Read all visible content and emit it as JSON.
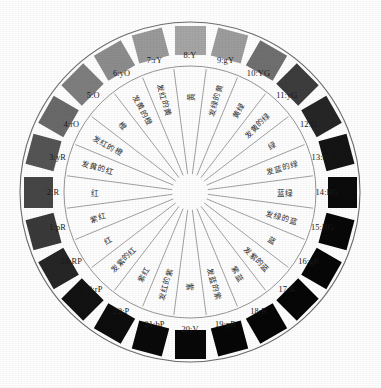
{
  "figure": {
    "type": "color-wheel",
    "hue_count": 24,
    "background_color": "#ffffff",
    "ring_outline_color": "#6e6e6e",
    "spoke_color": "#7a7a7a",
    "label_color": "#1a1a1a"
  },
  "chart_data": {
    "type": "pie",
    "xlabel": "",
    "ylabel": "",
    "legend": "none",
    "grid": false,
    "categories": [
      "1:pR",
      "2:R",
      "3:yR",
      "4:rO",
      "5:O",
      "6:yO",
      "7:rY",
      "8:Y",
      "9:gY",
      "10:YG",
      "11:yG",
      "12:G",
      "13:bG",
      "14:BG",
      "15:BG",
      "16:gB",
      "17:B",
      "18:B",
      "19:pB",
      "20:V",
      "21:bP",
      "22:P",
      "23:rP",
      "24:RP"
    ],
    "values": [
      15,
      15,
      15,
      15,
      15,
      15,
      15,
      15,
      15,
      15,
      15,
      15,
      15,
      15,
      15,
      15,
      15,
      15,
      15,
      15,
      15,
      15,
      15,
      15
    ],
    "swatch_colors": [
      "#3a3a3a",
      "#464646",
      "#555555",
      "#6a6a6a",
      "#7e7e7e",
      "#8d8d8d",
      "#9a9a9a",
      "#a6a6a6",
      "#9d9d9d",
      "#707070",
      "#3d3d3d",
      "#262626",
      "#141414",
      "#0b0b0b",
      "#080808",
      "#070707",
      "#060606",
      "#060606",
      "#070707",
      "#080808",
      "#0a0a0a",
      "#0d0d0d",
      "#121212",
      "#262626"
    ]
  },
  "outer_labels": [
    {
      "id": 1,
      "code": "1:pR"
    },
    {
      "id": 2,
      "code": "2:R"
    },
    {
      "id": 3,
      "code": "3:yR"
    },
    {
      "id": 4,
      "code": "4:rO"
    },
    {
      "id": 5,
      "code": "5:O"
    },
    {
      "id": 6,
      "code": "6:yO"
    },
    {
      "id": 7,
      "code": "7:rY"
    },
    {
      "id": 8,
      "code": "8:Y"
    },
    {
      "id": 9,
      "code": "9:gY"
    },
    {
      "id": 10,
      "code": "10:YG"
    },
    {
      "id": 11,
      "code": "11:yG"
    },
    {
      "id": 12,
      "code": "12:G"
    },
    {
      "id": 13,
      "code": "13:bG"
    },
    {
      "id": 14,
      "code": "14:BG"
    },
    {
      "id": 15,
      "code": "15:BG"
    },
    {
      "id": 16,
      "code": "16:gB"
    },
    {
      "id": 17,
      "code": "17:B"
    },
    {
      "id": 18,
      "code": "18:B"
    },
    {
      "id": 19,
      "code": "19:pB"
    },
    {
      "id": 20,
      "code": "20:V"
    },
    {
      "id": 21,
      "code": "21:bP"
    },
    {
      "id": 22,
      "code": "22:P"
    },
    {
      "id": 23,
      "code": "23:rP"
    },
    {
      "id": 24,
      "code": "24:RP"
    }
  ],
  "inner_labels": [
    {
      "id": 1,
      "name": "紫红"
    },
    {
      "id": 2,
      "name": "红"
    },
    {
      "id": 3,
      "name": "发黄的红"
    },
    {
      "id": 4,
      "name": "发红的橙"
    },
    {
      "id": 5,
      "name": "橙"
    },
    {
      "id": 6,
      "name": "发黄的橙"
    },
    {
      "id": 7,
      "name": "发红的黄"
    },
    {
      "id": 8,
      "name": "黄"
    },
    {
      "id": 9,
      "name": "发绿的黄"
    },
    {
      "id": 10,
      "name": "黄绿"
    },
    {
      "id": 11,
      "name": "发黄的绿"
    },
    {
      "id": 12,
      "name": "绿"
    },
    {
      "id": 13,
      "name": "发蓝的绿"
    },
    {
      "id": 14,
      "name": "蓝绿"
    },
    {
      "id": 15,
      "name": "发绿的蓝"
    },
    {
      "id": 16,
      "name": "蓝"
    },
    {
      "id": 17,
      "name": "发紫的蓝"
    },
    {
      "id": 18,
      "name": "紫蓝"
    },
    {
      "id": 19,
      "name": "发蓝的紫"
    },
    {
      "id": 20,
      "name": "紫"
    },
    {
      "id": 21,
      "name": "发红的紫"
    },
    {
      "id": 22,
      "name": "紫红"
    },
    {
      "id": 23,
      "name": "发紫的红"
    },
    {
      "id": 24,
      "name": "红"
    }
  ]
}
